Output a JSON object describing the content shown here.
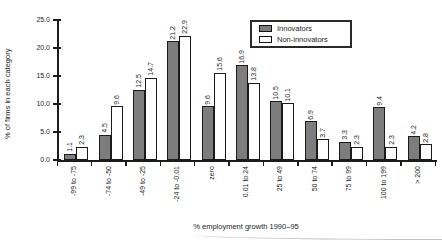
{
  "chart_data": {
    "type": "bar",
    "title": "",
    "xlabel": "% employment growth 1990–95",
    "ylabel": "% of firms in each category",
    "ylim": [
      0,
      25
    ],
    "ytick_values": [
      0,
      5,
      10,
      15,
      20,
      25
    ],
    "ytick_labels": [
      "0.0",
      "5.0",
      "10.0",
      "15.0",
      "20.0",
      "25.0"
    ],
    "grid": false,
    "legend_position": "top-right-inside",
    "bar_outline_color": "#1b1b1b",
    "categories": [
      "-99 to -75",
      "-74 to -50",
      "-49 to -25",
      "-24 to -0.01",
      "zero",
      "0.01 to 24",
      "25 to 49",
      "50 to 74",
      "75 to 99",
      "100 to 199",
      "> 200"
    ],
    "series": [
      {
        "name": "Innovators",
        "color": "#7d7d7d",
        "values": [
          1.1,
          4.5,
          12.5,
          21.2,
          9.6,
          16.9,
          10.5,
          6.9,
          3.3,
          9.4,
          4.2
        ]
      },
      {
        "name": "Non-innovators",
        "color": "#ffffff",
        "values": [
          2.3,
          9.6,
          14.7,
          22.9,
          15.6,
          13.8,
          10.1,
          3.7,
          2.3,
          2.3,
          2.8
        ]
      }
    ]
  }
}
